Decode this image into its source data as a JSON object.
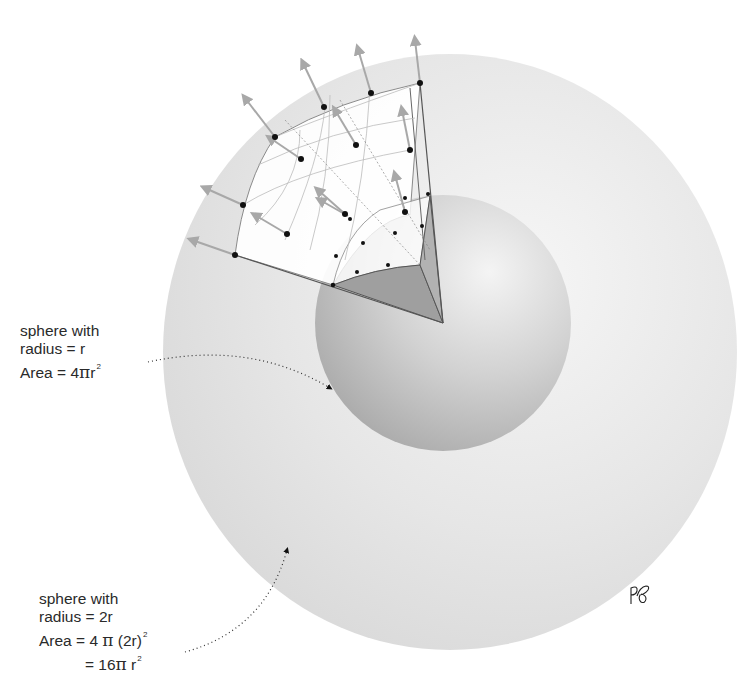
{
  "diagram": {
    "colors": {
      "outer_sphere": "#e4e4e4",
      "inner_sphere": "#c6c6c6",
      "patch": "#ffffff",
      "wedge": "#9f9f9f",
      "arrow": "#a8a8a8",
      "dot": "#111111",
      "text": "#2a2a2a"
    },
    "inner_label": {
      "line1": "sphere with",
      "line2": "radius = r",
      "line3_prefix": "Area = 4",
      "line3_pi": "π",
      "line3_suffix": "r",
      "line3_exp": "2"
    },
    "outer_label": {
      "line1": "sphere with",
      "line2": "radius = 2r",
      "line3_prefix": "Area = 4 ",
      "line3_pi": "π",
      "line3_suffix": " (2r)",
      "line3_exp": "2",
      "line4_prefix": "= 16",
      "line4_pi": "π",
      "line4_suffix": " r",
      "line4_exp": "2"
    },
    "signature": "RF"
  }
}
